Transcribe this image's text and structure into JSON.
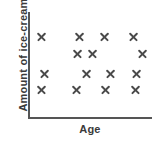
{
  "chart_data": {
    "type": "scatter",
    "title": "",
    "xlabel": "Age",
    "ylabel": "Amount of ice-cream",
    "grid": false,
    "legend": null,
    "marker": "x",
    "marker_color": "#4a4a4a",
    "axis_color": "#555555",
    "xlim": [
      0,
      10
    ],
    "ylim": [
      0,
      10
    ],
    "xticks": [],
    "yticks": [],
    "note": "No tick marks or numeric scale labels are printed on either axis; points are read as relative positions only.",
    "n_points": 15,
    "points": [
      {
        "x": 0.97,
        "y": 7.95
      },
      {
        "x": 4.03,
        "y": 7.95
      },
      {
        "x": 6.13,
        "y": 7.95
      },
      {
        "x": 8.47,
        "y": 7.95
      },
      {
        "x": 3.87,
        "y": 6.19
      },
      {
        "x": 5.16,
        "y": 6.19
      },
      {
        "x": 9.19,
        "y": 6.19
      },
      {
        "x": 1.21,
        "y": 4.24
      },
      {
        "x": 4.6,
        "y": 4.24
      },
      {
        "x": 6.61,
        "y": 4.24
      },
      {
        "x": 8.71,
        "y": 4.24
      },
      {
        "x": 0.97,
        "y": 2.67
      },
      {
        "x": 3.79,
        "y": 2.67
      },
      {
        "x": 6.21,
        "y": 2.67
      },
      {
        "x": 8.63,
        "y": 2.67
      }
    ]
  },
  "axes": {
    "x_title": "Age",
    "y_title": "Amount of ice-cream"
  }
}
